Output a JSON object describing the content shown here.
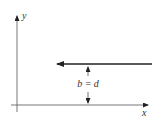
{
  "diagram": {
    "axes": {
      "x_label": "x",
      "y_label": "y"
    },
    "arrow": {
      "direction": "left",
      "description": "horizontal arrow at height b above x-axis"
    },
    "dimension": {
      "label": "b = d"
    },
    "colors": {
      "line": "#222222",
      "axis": "#444444"
    }
  }
}
